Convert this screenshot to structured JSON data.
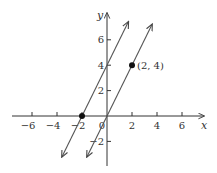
{
  "chart_data": {
    "type": "line",
    "title": "",
    "xlabel": "x",
    "ylabel": "y",
    "xlim": [
      -7.3,
      7.5
    ],
    "ylim": [
      -3.6,
      7.2
    ],
    "grid": false,
    "x_ticks": [
      -6,
      -4,
      -2,
      0,
      2,
      4,
      6
    ],
    "x_tick_labels": [
      "−6",
      "−4",
      "−2",
      "0",
      "2",
      "4",
      "6"
    ],
    "y_ticks": [
      -2,
      2,
      4,
      6
    ],
    "y_tick_labels": [
      "−2",
      "2",
      "4",
      "6"
    ],
    "series": [
      {
        "name": "y = 2x + 4",
        "slope": 2,
        "intercept": 4,
        "x": [
          -3.6,
          1.7
        ],
        "y": [
          -3.2,
          7.4
        ],
        "arrows": "both"
      },
      {
        "name": "y = 2x",
        "slope": 2,
        "intercept": 0,
        "x": [
          -1.6,
          3.6
        ],
        "y": [
          -3.2,
          7.2
        ],
        "arrows": "both"
      }
    ],
    "points": [
      {
        "x": -2,
        "y": 0,
        "label": ""
      },
      {
        "x": 2,
        "y": 4,
        "label": "(2, 4)"
      }
    ],
    "colors": {
      "axes": "#333333",
      "lines": "#555555",
      "points": "#111111"
    }
  }
}
